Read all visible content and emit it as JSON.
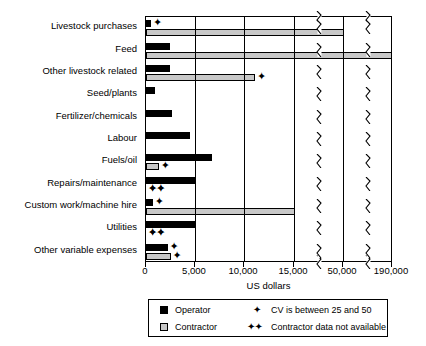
{
  "chart_data": {
    "type": "bar",
    "orientation": "horizontal",
    "title": "",
    "xlabel": "US dollars",
    "ylabel": "",
    "grid": true,
    "legend_position": "bottom",
    "axis_note": "x-axis has two scale breaks: linear 0-15,000, then compressed to 50,000 and 190,000",
    "xticks": [
      {
        "label": "0",
        "value": 0,
        "px": 145
      },
      {
        "label": "5,000",
        "value": 5000,
        "px": 194
      },
      {
        "label": "10,000",
        "value": 10000,
        "px": 243
      },
      {
        "label": "15,000",
        "value": 15000,
        "px": 293
      },
      {
        "label": "50,000",
        "value": 50000,
        "px": 342
      },
      {
        "label": "190,000",
        "value": 190000,
        "px": 391
      }
    ],
    "categories": [
      "Livestock purchases",
      "Feed",
      "Other livestock related",
      "Seed/plants",
      "Fertilizer/chemicals",
      "Labour",
      "Fuels/oil",
      "Repairs/maintenance",
      "Custom work/machine hire",
      "Utilities",
      "Other variable expenses"
    ],
    "series": [
      {
        "name": "Operator",
        "color": "#000000",
        "values": [
          500,
          2400,
          2400,
          900,
          2700,
          4500,
          6700,
          5000,
          700,
          5000,
          2200
        ]
      },
      {
        "name": "Contractor",
        "color": "#c8c8c8",
        "values": [
          52000,
          190000,
          11100,
          null,
          null,
          null,
          1300,
          null,
          15600,
          null,
          2500
        ]
      }
    ],
    "markers": {
      "operator": [
        "cv",
        "",
        "",
        "",
        "",
        "",
        "",
        "cvcv",
        "cv",
        "cvcv",
        "cv"
      ],
      "contractor": [
        "",
        "",
        "cv",
        "",
        "",
        "",
        "cv",
        "",
        "",
        "",
        "cv"
      ]
    }
  },
  "legend": {
    "items": [
      {
        "label": "Operator",
        "swatch": "operator-swatch"
      },
      {
        "label": "Contractor",
        "swatch": "contractor-swatch"
      }
    ],
    "notes": [
      {
        "mark": "✦",
        "text": "CV is between 25 and 50"
      },
      {
        "mark": "✦✦",
        "text": "Contractor data not available"
      }
    ]
  }
}
